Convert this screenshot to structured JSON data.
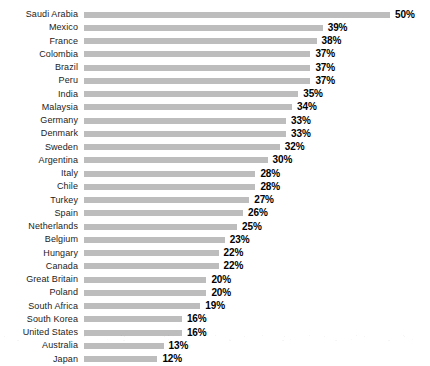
{
  "chart_data": {
    "type": "bar",
    "orientation": "horizontal",
    "title": "",
    "subtitle": "",
    "xlabel": "",
    "ylabel": "",
    "grid": false,
    "legend": null,
    "value_suffix": "%",
    "xlim": [
      0,
      50
    ],
    "categories": [
      "Saudi Arabia",
      "Mexico",
      "France",
      "Colombia",
      "Brazil",
      "Peru",
      "India",
      "Malaysia",
      "Germany",
      "Denmark",
      "Sweden",
      "Argentina",
      "Italy",
      "Chile",
      "Turkey",
      "Spain",
      "Netherlands",
      "Belgium",
      "Hungary",
      "Canada",
      "Great Britain",
      "Poland",
      "South Africa",
      "South Korea",
      "United States",
      "Australia",
      "Japan"
    ],
    "values": [
      50,
      39,
      38,
      37,
      37,
      37,
      35,
      34,
      33,
      33,
      32,
      30,
      28,
      28,
      27,
      26,
      25,
      23,
      22,
      22,
      20,
      20,
      19,
      16,
      16,
      13,
      12
    ],
    "value_labels": [
      "50%",
      "39%",
      "38%",
      "37%",
      "37%",
      "37%",
      "35%",
      "34%",
      "33%",
      "33%",
      "32%",
      "30%",
      "28%",
      "28%",
      "27%",
      "26%",
      "25%",
      "23%",
      "22%",
      "22%",
      "20%",
      "20%",
      "19%",
      "16%",
      "16%",
      "13%",
      "12%"
    ],
    "bar_color": "#bdbdbd",
    "label_color": "#1c1c1c",
    "value_color": "#000000",
    "background_color": "#ffffff"
  }
}
